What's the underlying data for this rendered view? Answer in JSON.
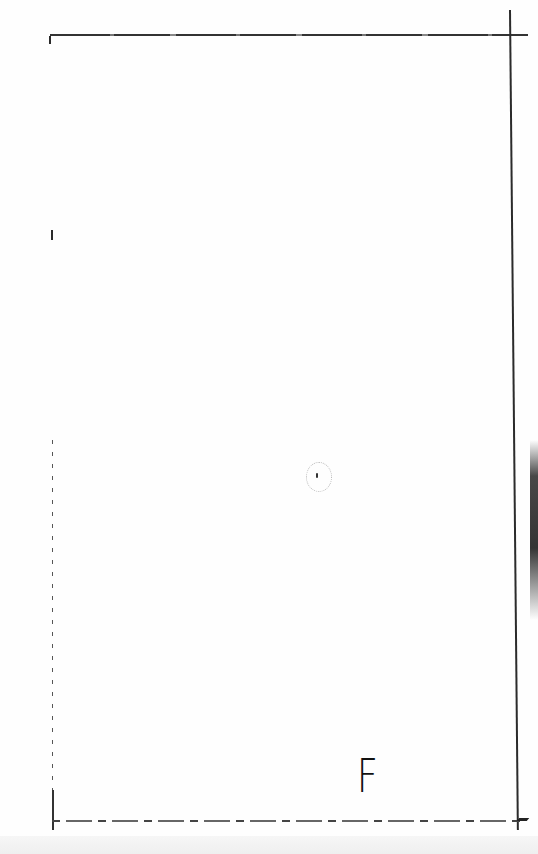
{
  "page": {
    "type": "scanned-sheet",
    "handwritten_mark": "F",
    "colors": {
      "paper": "#fefefe",
      "ink": "#2a2a2a"
    }
  }
}
